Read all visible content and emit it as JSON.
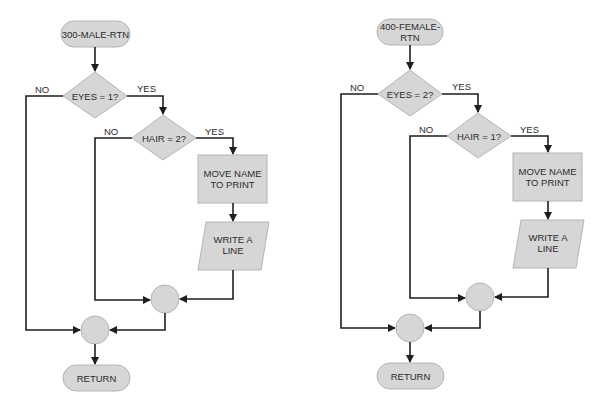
{
  "flowcharts": [
    {
      "start": {
        "line1": "300-MALE-RTN",
        "line2": ""
      },
      "decision1": {
        "label": "EYES = 1?",
        "no": "NO",
        "yes": "YES"
      },
      "decision2": {
        "label": "HAIR = 2?",
        "no": "NO",
        "yes": "YES"
      },
      "process": {
        "line1": "MOVE NAME",
        "line2": "TO PRINT"
      },
      "io": {
        "line1": "WRITE A",
        "line2": "LINE"
      },
      "end": {
        "label": "RETURN"
      }
    },
    {
      "start": {
        "line1": "400-FEMALE-",
        "line2": "RTN"
      },
      "decision1": {
        "label": "EYES = 2?",
        "no": "NO",
        "yes": "YES"
      },
      "decision2": {
        "label": "HAIR = 1?",
        "no": "NO",
        "yes": "YES"
      },
      "process": {
        "line1": "MOVE NAME",
        "line2": "TO PRINT"
      },
      "io": {
        "line1": "WRITE A",
        "line2": "LINE"
      },
      "end": {
        "label": "RETURN"
      }
    }
  ],
  "colors": {
    "shape_fill": "#d6d6d6",
    "shape_stroke": "#b4b4b4",
    "line": "#1e1e1e",
    "text": "#2c2c2c"
  }
}
